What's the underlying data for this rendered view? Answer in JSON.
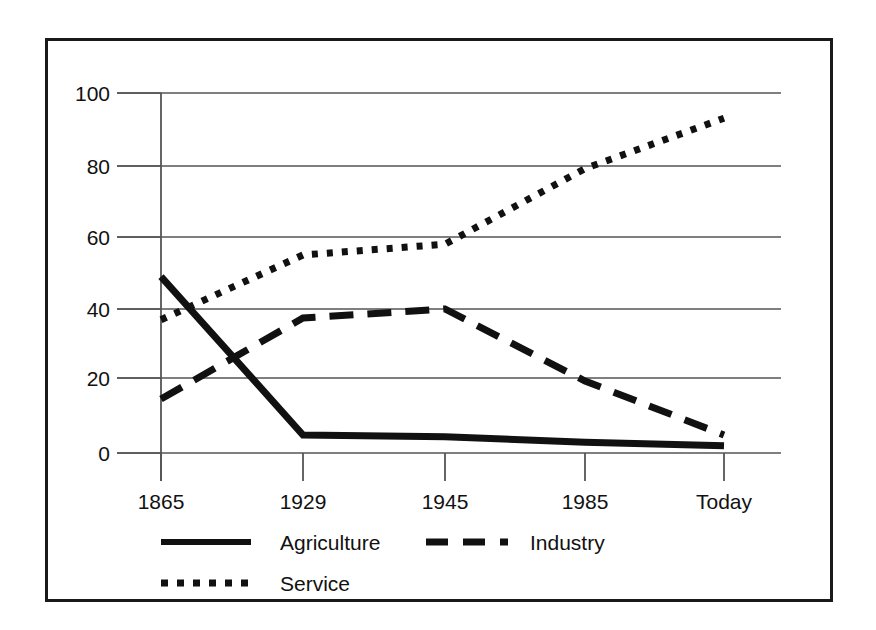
{
  "chart_data": {
    "type": "line",
    "title": "",
    "subtitle": "",
    "xlabel": "",
    "ylabel": "",
    "categories": [
      "1865",
      "1929",
      "1945",
      "1985",
      "Today"
    ],
    "x_tick_labels": [
      "1865",
      "1929",
      "1945",
      "1985",
      "Today"
    ],
    "y_tick_labels": [
      "0",
      "20",
      "40",
      "60",
      "80",
      "100"
    ],
    "y_ticks": [
      0,
      20,
      40,
      60,
      80,
      100
    ],
    "ylim": [
      0,
      100
    ],
    "grid": "horizontal",
    "legend_position": "bottom-left",
    "series": [
      {
        "name": "Agriculture",
        "style": "solid",
        "color": "#111111",
        "values": [
          49,
          5,
          4.5,
          3,
          2
        ]
      },
      {
        "name": "Industry",
        "style": "dashed",
        "color": "#111111",
        "values": [
          15,
          37.5,
          40,
          20,
          5
        ]
      },
      {
        "name": "Service",
        "style": "dotted",
        "color": "#111111",
        "values": [
          37,
          55,
          58,
          79,
          93
        ]
      }
    ]
  },
  "legend": {
    "entries": [
      {
        "label": "Agriculture",
        "style": "solid"
      },
      {
        "label": "Industry",
        "style": "dashed"
      },
      {
        "label": "Service",
        "style": "dotted"
      }
    ]
  },
  "colors": {
    "ink": "#111111",
    "grid": "#555555",
    "frame": "#1a1a1a",
    "background": "#ffffff"
  }
}
